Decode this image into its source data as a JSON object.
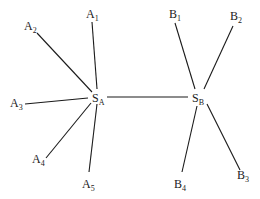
{
  "diagram": {
    "type": "star-network",
    "hubs": [
      {
        "id": "SA",
        "base": "S",
        "sub": "A",
        "x": 92,
        "y": 102
      },
      {
        "id": "SB",
        "base": "S",
        "sub": "B",
        "x": 192,
        "y": 102
      }
    ],
    "nodes": [
      {
        "id": "A1",
        "base": "A",
        "sub": "1",
        "x": 86,
        "y": 18
      },
      {
        "id": "A2",
        "base": "A",
        "sub": "2",
        "x": 24,
        "y": 30
      },
      {
        "id": "A3",
        "base": "A",
        "sub": "3",
        "x": 10,
        "y": 107
      },
      {
        "id": "A4",
        "base": "A",
        "sub": "4",
        "x": 32,
        "y": 163
      },
      {
        "id": "A5",
        "base": "A",
        "sub": "5",
        "x": 82,
        "y": 188
      },
      {
        "id": "B1",
        "base": "B",
        "sub": "1",
        "x": 169,
        "y": 18
      },
      {
        "id": "B2",
        "base": "B",
        "sub": "2",
        "x": 230,
        "y": 20
      },
      {
        "id": "B3",
        "base": "B",
        "sub": "3",
        "x": 237,
        "y": 179
      },
      {
        "id": "B4",
        "base": "B",
        "sub": "4",
        "x": 174,
        "y": 188
      }
    ],
    "edges": [
      {
        "from": "A1",
        "to": "SA",
        "x1": 92,
        "y1": 22,
        "x2": 97,
        "y2": 89
      },
      {
        "from": "A2",
        "to": "SA",
        "x1": 37,
        "y1": 33,
        "x2": 92,
        "y2": 92
      },
      {
        "from": "A3",
        "to": "SA",
        "x1": 25,
        "y1": 104,
        "x2": 88,
        "y2": 98
      },
      {
        "from": "A4",
        "to": "SA",
        "x1": 46,
        "y1": 158,
        "x2": 91,
        "y2": 103
      },
      {
        "from": "A5",
        "to": "SA",
        "x1": 89,
        "y1": 172,
        "x2": 97,
        "y2": 104
      },
      {
        "from": "SA",
        "to": "SB",
        "x1": 107,
        "y1": 97,
        "x2": 188,
        "y2": 97
      },
      {
        "from": "B1",
        "to": "SB",
        "x1": 175,
        "y1": 23,
        "x2": 195,
        "y2": 89
      },
      {
        "from": "B2",
        "to": "SB",
        "x1": 233,
        "y1": 26,
        "x2": 204,
        "y2": 89
      },
      {
        "from": "B3",
        "to": "SB",
        "x1": 240,
        "y1": 170,
        "x2": 207,
        "y2": 104
      },
      {
        "from": "B4",
        "to": "SB",
        "x1": 182,
        "y1": 172,
        "x2": 197,
        "y2": 106
      }
    ]
  }
}
